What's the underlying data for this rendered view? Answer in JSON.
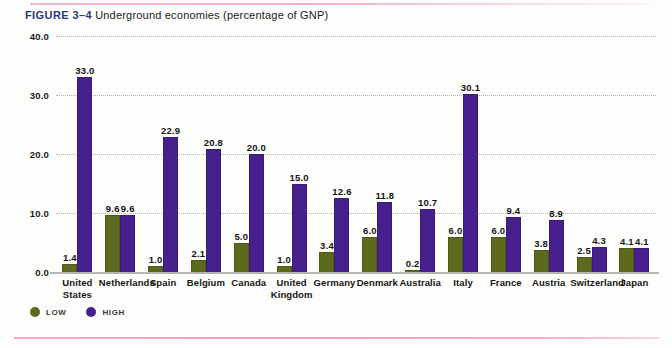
{
  "caption": {
    "figure_label": "FIGURE 3–4",
    "text": "Underground economies  (percentage of GNP)"
  },
  "legend": {
    "items": [
      {
        "label": "LOW",
        "marker": "circle-marker-low",
        "color": "#5d6a1d"
      },
      {
        "label": "HIGH",
        "marker": "circle-marker-high",
        "color": "#46208d"
      }
    ]
  },
  "axis": {
    "y_ticks": [
      "0.0",
      "10.0",
      "20.0",
      "30.0",
      "40.0"
    ]
  },
  "colors": {
    "low": "#5d6a1d",
    "high": "#46208d",
    "figure_label": "#2a3a79",
    "rule": "#f5a4bf",
    "background": "#fdfdfb"
  },
  "chart_data": {
    "type": "bar",
    "title": "Underground economies (percentage of GNP)",
    "xlabel": "",
    "ylabel": "",
    "ylim": [
      0,
      40
    ],
    "ytick_values": [
      0,
      10,
      20,
      30,
      40
    ],
    "grid": true,
    "legend_position": "bottom-left",
    "categories": [
      "United States",
      "Netherlands",
      "Spain",
      "Belgium",
      "Canada",
      "United Kingdom",
      "Germany",
      "Denmark",
      "Australia",
      "Italy",
      "France",
      "Austria",
      "Switzerland",
      "Japan"
    ],
    "category_lines": [
      [
        "United",
        "States"
      ],
      [
        "Netherlands"
      ],
      [
        "Spain"
      ],
      [
        "Belgium"
      ],
      [
        "Canada"
      ],
      [
        "United",
        "Kingdom"
      ],
      [
        "Germany"
      ],
      [
        "Denmark"
      ],
      [
        "Australia"
      ],
      [
        "Italy"
      ],
      [
        "France"
      ],
      [
        "Austria"
      ],
      [
        "Switzerland"
      ],
      [
        "Japan"
      ]
    ],
    "series": [
      {
        "name": "LOW",
        "color": "#5d6a1d",
        "values": [
          1.4,
          9.6,
          1.0,
          2.1,
          5.0,
          1.0,
          3.4,
          6.0,
          0.2,
          6.0,
          6.0,
          3.8,
          2.5,
          4.1
        ],
        "labels": [
          "1.4",
          "9.6",
          "1.0",
          "2.1",
          "5.0",
          "1.0",
          "3.4",
          "6.0",
          "0.2",
          "6.0",
          "6.0",
          "3.8",
          "2.5",
          "4.1"
        ]
      },
      {
        "name": "HIGH",
        "color": "#46208d",
        "values": [
          33.0,
          9.6,
          22.9,
          20.8,
          20.0,
          15.0,
          12.6,
          11.8,
          10.7,
          30.1,
          9.4,
          8.9,
          4.3,
          4.1
        ],
        "labels": [
          "33.0",
          "9.6",
          "22.9",
          "20.8",
          "20.0",
          "15.0",
          "12.6",
          "11.8",
          "10.7",
          "30.1",
          "9.4",
          "8.9",
          "4.3",
          "4.1"
        ]
      }
    ]
  }
}
